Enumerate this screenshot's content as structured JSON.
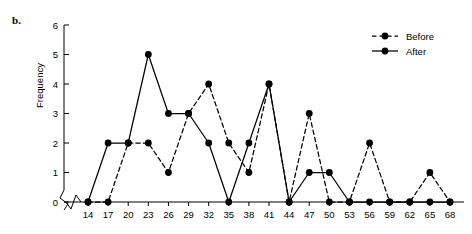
{
  "figure": {
    "panel_label": "b.",
    "ylabel": "Frequency"
  },
  "legend": {
    "position": "top-right",
    "entries": [
      {
        "label": "Before",
        "style": "dashed",
        "marker": "filled-circle",
        "color": "#000000"
      },
      {
        "label": "After",
        "style": "solid",
        "marker": "filled-circle",
        "color": "#000000"
      }
    ]
  },
  "axes": {
    "x_ticks": [
      "14",
      "17",
      "20",
      "23",
      "26",
      "29",
      "32",
      "35",
      "38",
      "41",
      "44",
      "47",
      "50",
      "53",
      "56",
      "59",
      "62",
      "65",
      "68"
    ],
    "y_ticks": [
      "0",
      "1",
      "2",
      "3",
      "4",
      "5",
      "6"
    ],
    "y_axis_break": true
  },
  "chart_data": {
    "type": "line",
    "title": "",
    "xlabel": "",
    "ylabel": "Frequency",
    "categories": [
      14,
      17,
      20,
      23,
      26,
      29,
      32,
      35,
      38,
      41,
      44,
      47,
      50,
      53,
      56,
      59,
      62,
      65,
      68
    ],
    "xlim": [
      14,
      68
    ],
    "ylim": [
      0,
      6
    ],
    "grid": false,
    "legend_position": "top-right",
    "series": [
      {
        "name": "Before",
        "style": "dashed",
        "marker": "filled-circle",
        "color": "#000000",
        "values": [
          0,
          0,
          2,
          2,
          1,
          3,
          4,
          2,
          1,
          4,
          0,
          3,
          0,
          0,
          2,
          0,
          0,
          1,
          0
        ]
      },
      {
        "name": "After",
        "style": "solid",
        "marker": "filled-circle",
        "color": "#000000",
        "values": [
          0,
          2,
          2,
          5,
          3,
          3,
          2,
          0,
          2,
          4,
          0,
          1,
          1,
          0,
          0,
          0,
          0,
          0,
          0
        ]
      }
    ]
  }
}
